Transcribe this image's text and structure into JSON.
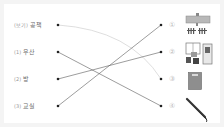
{
  "left_items": [
    {
      "marker": "(보기)",
      "word": "공책"
    },
    {
      "marker": "(1)",
      "word": "우산"
    },
    {
      "marker": "(2)",
      "word": "방"
    },
    {
      "marker": "(3)",
      "word": "교실"
    }
  ],
  "right_items": [
    {
      "marker": "①",
      "icon": "classroom-icon"
    },
    {
      "marker": "②",
      "icon": "room-icon"
    },
    {
      "marker": "③",
      "icon": "notebook-icon"
    },
    {
      "marker": "④",
      "icon": "umbrella-icon"
    }
  ],
  "connections": [
    {
      "from": "공책",
      "to": "③",
      "style": "example"
    },
    {
      "from": "우산",
      "to": "④"
    },
    {
      "from": "방",
      "to": "②"
    },
    {
      "from": "교실",
      "to": "①"
    }
  ],
  "colors": {
    "line": "#555555",
    "example_line": "#d4d4d4",
    "dot": "#222222"
  }
}
